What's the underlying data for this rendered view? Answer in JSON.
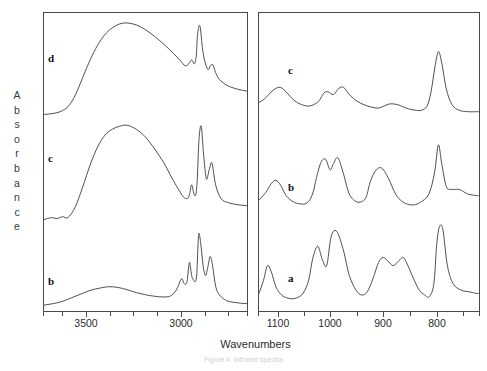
{
  "figure": {
    "ylabel_text": "Absorbance",
    "xlabel": "Wavenumbers",
    "caption": "Figure 4. Infrared spectra",
    "line_color": "#3c3c3c",
    "axis_color": "#4a4a4a",
    "background": "#ffffff"
  },
  "panels": {
    "left": {
      "name": "high-wavenumber-panel",
      "xlim": [
        3750,
        2650
      ],
      "tick_labels": [
        "3500",
        "3000"
      ],
      "tick_label_x": [
        86,
        181
      ],
      "minor_ticks_x": [
        43,
        62,
        86,
        110,
        133,
        157,
        181,
        205,
        228,
        247
      ],
      "curves": [
        "d",
        "c",
        "b"
      ]
    },
    "right": {
      "name": "fingerprint-panel",
      "xlim": [
        1150,
        760
      ],
      "tick_labels": [
        "1100",
        "1000",
        "900",
        "800"
      ],
      "tick_label_x": [
        278,
        330,
        383,
        437
      ],
      "minor_ticks_x": [
        258,
        278,
        304,
        330,
        357,
        383,
        410,
        437,
        463,
        479
      ],
      "curves": [
        "c",
        "b",
        "a"
      ]
    }
  },
  "curve_labels": [
    {
      "id": "d",
      "text": "d",
      "panel": "left",
      "x": 48,
      "y": 52
    },
    {
      "id": "c",
      "text": "c",
      "panel": "left",
      "x": 48,
      "y": 152
    },
    {
      "id": "b",
      "text": "b",
      "panel": "left",
      "x": 48,
      "y": 275
    },
    {
      "id": "c",
      "text": "c",
      "panel": "right",
      "x": 288,
      "y": 64
    },
    {
      "id": "b",
      "text": "b",
      "panel": "right",
      "x": 288,
      "y": 181
    },
    {
      "id": "a",
      "text": "a",
      "panel": "right",
      "x": 288,
      "y": 272
    }
  ],
  "chart_data": {
    "type": "line",
    "title": "",
    "xlabel": "Wavenumbers",
    "ylabel": "Absorbance",
    "grid": false,
    "legend": "inline-curve-letters",
    "x_axis_direction": "decreasing",
    "panels": [
      {
        "panel": "left",
        "xlim": [
          3750,
          2650
        ],
        "xticks": [
          3500,
          3000
        ],
        "series": [
          {
            "name": "d",
            "offset_label": "top trace",
            "peaks_cm1": [
              3400,
              2960,
              2920,
              2850
            ],
            "peak_notes": [
              "broad O-H stretch ~3400",
              "shoulder ~2960",
              "sharp C-H ~2920",
              "shoulder ~2850"
            ],
            "x": [
              3750,
              3700,
              3660,
              3620,
              3580,
              3540,
              3500,
              3460,
              3420,
              3380,
              3340,
              3300,
              3250,
              3200,
              3150,
              3100,
              3050,
              3010,
              2985,
              2965,
              2950,
              2935,
              2925,
              2918,
              2905,
              2890,
              2875,
              2860,
              2848,
              2835,
              2820,
              2800,
              2760,
              2720,
              2680,
              2650
            ],
            "y": [
              6,
              7,
              9,
              14,
              26,
              44,
              62,
              77,
              88,
              95,
              99,
              100,
              98,
              93,
              86,
              78,
              69,
              61,
              56,
              58,
              62,
              58,
              66,
              88,
              97,
              72,
              58,
              52,
              56,
              57,
              49,
              42,
              36,
              33,
              31,
              30
            ]
          },
          {
            "name": "c",
            "offset_label": "middle trace",
            "peaks_cm1": [
              3400,
              2960,
              2920,
              2850
            ],
            "x": [
              3750,
              3710,
              3680,
              3650,
              3620,
              3580,
              3540,
              3500,
              3460,
              3420,
              3380,
              3340,
              3300,
              3250,
              3200,
              3150,
              3100,
              3060,
              3020,
              2995,
              2975,
              2962,
              2950,
              2938,
              2928,
              2920,
              2910,
              2898,
              2885,
              2870,
              2855,
              2840,
              2820,
              2790,
              2750,
              2700,
              2650
            ],
            "y": [
              5,
              7,
              6,
              8,
              7,
              18,
              38,
              60,
              78,
              90,
              96,
              99,
              100,
              96,
              88,
              76,
              62,
              48,
              35,
              28,
              26,
              30,
              40,
              31,
              30,
              44,
              86,
              99,
              70,
              46,
              55,
              62,
              40,
              26,
              22,
              20,
              19
            ]
          },
          {
            "name": "b",
            "offset_label": "bottom trace",
            "peaks_cm1": [
              3400,
              2960,
              2920,
              2850
            ],
            "x": [
              3750,
              3700,
              3650,
              3600,
              3550,
              3500,
              3450,
              3400,
              3350,
              3300,
              3250,
              3200,
              3150,
              3100,
              3060,
              3030,
              3005,
              2990,
              2975,
              2962,
              2950,
              2940,
              2930,
              2922,
              2912,
              2900,
              2888,
              2875,
              2862,
              2850,
              2838,
              2820,
              2800,
              2760,
              2700,
              2650
            ],
            "y": [
              4,
              6,
              9,
              14,
              19,
              24,
              27,
              29,
              28,
              25,
              21,
              18,
              16,
              15,
              17,
              26,
              40,
              33,
              36,
              62,
              44,
              38,
              36,
              47,
              100,
              86,
              58,
              44,
              56,
              70,
              60,
              30,
              18,
              10,
              7,
              6
            ]
          }
        ]
      },
      {
        "panel": "right",
        "xlim": [
          1150,
          760
        ],
        "xticks": [
          1100,
          1000,
          900,
          800
        ],
        "series": [
          {
            "name": "c",
            "offset_label": "top trace",
            "peaks_cm1": [
              1110,
              1035,
              1000,
              950,
              875,
              835
            ],
            "x": [
              1150,
              1140,
              1125,
              1112,
              1100,
              1088,
              1075,
              1060,
              1045,
              1035,
              1028,
              1018,
              1008,
              1000,
              992,
              982,
              970,
              958,
              948,
              938,
              928,
              918,
              905,
              895,
              885,
              872,
              862,
              852,
              845,
              838,
              832,
              826,
              818,
              808,
              795,
              780,
              765,
              760
            ],
            "y": [
              25,
              30,
              42,
              46,
              38,
              28,
              22,
              20,
              26,
              38,
              40,
              36,
              45,
              46,
              38,
              30,
              24,
              20,
              18,
              17,
              20,
              23,
              22,
              19,
              16,
              14,
              14,
              20,
              40,
              75,
              96,
              80,
              44,
              22,
              14,
              12,
              12,
              12
            ]
          },
          {
            "name": "b",
            "offset_label": "middle trace",
            "peaks_cm1": [
              1120,
              1050,
              1020,
              960,
              870,
              835
            ],
            "x": [
              1150,
              1138,
              1128,
              1120,
              1112,
              1102,
              1090,
              1078,
              1065,
              1055,
              1048,
              1040,
              1032,
              1024,
              1018,
              1010,
              1000,
              990,
              978,
              968,
              960,
              952,
              942,
              932,
              920,
              908,
              896,
              884,
              872,
              862,
              852,
              845,
              838,
              832,
              826,
              818,
              808,
              795,
              780,
              765,
              760
            ],
            "y": [
              22,
              32,
              44,
              48,
              42,
              28,
              20,
              17,
              18,
              30,
              52,
              72,
              76,
              62,
              70,
              78,
              56,
              30,
              20,
              20,
              26,
              48,
              62,
              64,
              50,
              30,
              20,
              16,
              16,
              20,
              26,
              38,
              62,
              95,
              70,
              40,
              36,
              36,
              30,
              28,
              28
            ]
          },
          {
            "name": "a",
            "offset_label": "bottom trace",
            "peaks_cm1": [
              1135,
              1060,
              1035,
              960,
              925,
              895,
              835
            ],
            "x": [
              1150,
              1142,
              1135,
              1128,
              1120,
              1110,
              1098,
              1085,
              1072,
              1062,
              1055,
              1046,
              1038,
              1030,
              1022,
              1012,
              1000,
              990,
              978,
              968,
              958,
              948,
              938,
              930,
              922,
              912,
              902,
              894,
              886,
              876,
              866,
              856,
              848,
              840,
              835,
              830,
              824,
              816,
              806,
              792,
              778,
              765,
              760
            ],
            "y": [
              18,
              34,
              52,
              44,
              26,
              16,
              12,
              12,
              18,
              34,
              60,
              76,
              60,
              52,
              88,
              94,
              70,
              40,
              22,
              16,
              20,
              36,
              56,
              62,
              58,
              52,
              58,
              62,
              52,
              36,
              22,
              16,
              14,
              30,
              78,
              100,
              96,
              52,
              30,
              22,
              20,
              18,
              18
            ]
          }
        ]
      }
    ]
  }
}
